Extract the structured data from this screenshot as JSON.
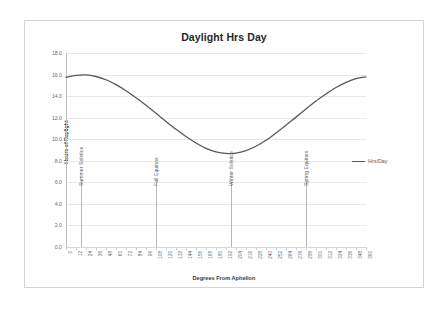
{
  "chart_data": {
    "type": "line",
    "title": "Daylight Hrs Day",
    "xlabel": "Degrees From Aphelion",
    "ylabel": "Hours of Daylight",
    "xlim": [
      0,
      360
    ],
    "ylim": [
      0,
      18
    ],
    "grid": true,
    "legend_position": "right",
    "y_ticks": [
      "0.0",
      "2.0",
      "4.0",
      "6.0",
      "8.0",
      "10.0",
      "12.0",
      "14.0",
      "16.0",
      "18.0"
    ],
    "y_tick_values": [
      0,
      2,
      4,
      6,
      8,
      10,
      12,
      14,
      16,
      18
    ],
    "x_ticks": [
      "0",
      "12",
      "24",
      "36",
      "48",
      "60",
      "72",
      "84",
      "96",
      "108",
      "120",
      "132",
      "144",
      "156",
      "168",
      "180",
      "192",
      "204",
      "216",
      "228",
      "240",
      "252",
      "264",
      "276",
      "288",
      "300",
      "312",
      "324",
      "336",
      "348",
      "360"
    ],
    "x_tick_values": [
      0,
      12,
      24,
      36,
      48,
      60,
      72,
      84,
      96,
      108,
      120,
      132,
      144,
      156,
      168,
      180,
      192,
      204,
      216,
      228,
      240,
      252,
      264,
      276,
      288,
      300,
      312,
      324,
      336,
      348,
      360
    ],
    "series": [
      {
        "name": "Hrs/Day",
        "color": "#595959",
        "x": [
          0,
          12,
          24,
          36,
          48,
          60,
          72,
          84,
          96,
          108,
          120,
          132,
          144,
          156,
          168,
          180,
          192,
          204,
          216,
          228,
          240,
          252,
          264,
          276,
          288,
          300,
          312,
          324,
          336,
          348,
          360
        ],
        "values": [
          15.75,
          15.93,
          15.97,
          15.82,
          15.52,
          15.07,
          14.5,
          13.85,
          13.15,
          12.4,
          11.65,
          10.92,
          10.25,
          9.65,
          9.15,
          8.82,
          8.68,
          8.72,
          8.95,
          9.35,
          9.9,
          10.58,
          11.3,
          12.05,
          12.8,
          13.55,
          14.2,
          14.8,
          15.28,
          15.63,
          15.78
        ]
      }
    ],
    "annotations": [
      {
        "label": "Summer Solstice",
        "x": 18
      },
      {
        "label": "Fall Equinox",
        "x": 108
      },
      {
        "label": "Winter Solstice",
        "x": 198
      },
      {
        "label": "Spring Equinox",
        "x": 288
      }
    ],
    "annotation_line_top": 6.0,
    "legend": [
      {
        "label": "Hrs/Day",
        "color": "#595959"
      }
    ]
  }
}
